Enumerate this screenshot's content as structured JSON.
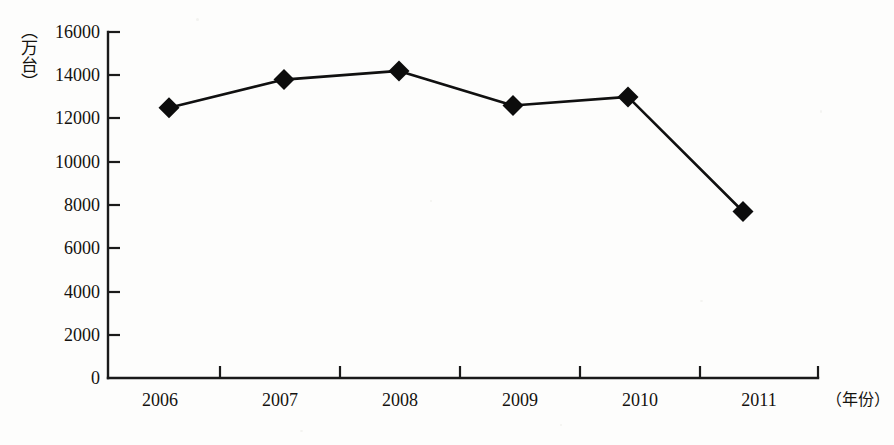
{
  "chart_data": {
    "type": "line",
    "title": "",
    "subtitle": "",
    "xlabel": "（年份）",
    "ylabel": "（万台）",
    "categories": [
      "2006",
      "2007",
      "2008",
      "2009",
      "2010",
      "2011"
    ],
    "values": [
      12500,
      13800,
      14200,
      12600,
      13000,
      7700
    ],
    "series": [
      {
        "name": "产量",
        "values": [
          12500,
          13800,
          14200,
          12600,
          13000,
          7700
        ]
      }
    ],
    "ylim": [
      0,
      16000
    ],
    "ytick_labels": [
      "0",
      "2000",
      "4000",
      "6000",
      "8000",
      "10000",
      "12000",
      "14000",
      "16000"
    ],
    "ytick_values": [
      0,
      2000,
      4000,
      6000,
      8000,
      10000,
      12000,
      14000,
      16000
    ],
    "xtick_labels": [
      "2006",
      "2007",
      "2008",
      "2009",
      "2010",
      "2011"
    ],
    "grid": false,
    "legend": false,
    "legend_position": "none",
    "marker": "diamond",
    "annotations": []
  },
  "style": {
    "line_color": "#101010",
    "marker_color": "#0c0c0c",
    "axis_color": "#1a1a1a",
    "text_color": "#14120f",
    "background_color": "#fdfdfc"
  }
}
